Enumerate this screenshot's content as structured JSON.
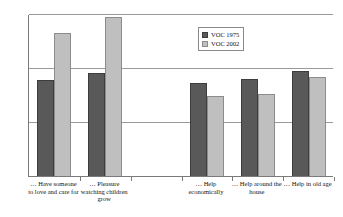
{
  "chart_data": {
    "type": "bar",
    "title": "",
    "subtitle": "",
    "xlabel": "",
    "ylabel": "",
    "ylim": [
      0,
      3
    ],
    "yticks": [
      "0",
      "1",
      "2",
      "3"
    ],
    "grid": "horizontal",
    "legend_position": "upper-center-right",
    "categories": [
      "… Have someone to love and care for",
      "… Pleasure watching children grow",
      "… Help economically",
      "… Help around the house",
      "… Help in old age"
    ],
    "category_lines": [
      [
        "… Have someone",
        "to love and care for"
      ],
      [
        "… Pleasure",
        "watching children",
        "grow"
      ],
      [
        "… Help",
        "economically"
      ],
      [
        "… Help around the",
        "house"
      ],
      [
        "… Help in old age"
      ]
    ],
    "series": [
      {
        "name": "VOC 1975",
        "color": "#595959",
        "values": [
          1.8,
          1.93,
          1.75,
          1.81,
          1.97
        ]
      },
      {
        "name": "VOC 2002",
        "color": "#bfbfbf",
        "values": [
          2.67,
          2.96,
          1.5,
          1.54,
          1.86
        ]
      }
    ],
    "group_slots": 6,
    "empty_slot_index": 2
  },
  "legend": {
    "entries": [
      {
        "label": "VOC 1975"
      },
      {
        "label": "VOC 2002"
      }
    ]
  }
}
